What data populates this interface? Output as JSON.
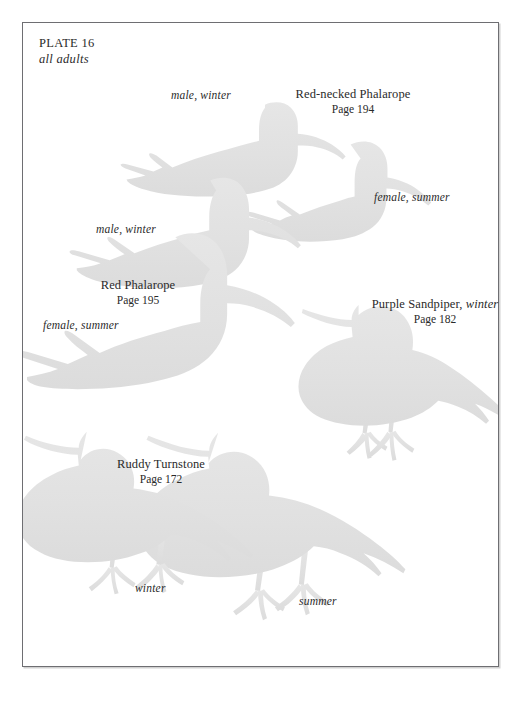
{
  "plate": {
    "number_label": "PLATE 16",
    "subtitle": "all adults",
    "background_color": "#ffffff",
    "frame_color": "#6e6e72",
    "silhouette_color": "#e2e2e2",
    "text_color": "#2e2e30"
  },
  "species": [
    {
      "id": "red-necked-phalarope",
      "name": "Red-necked Phalarope",
      "name_italic_suffix": "",
      "page": "Page 194",
      "morphs": [
        "male, winter",
        "female, summer"
      ]
    },
    {
      "id": "red-phalarope",
      "name": "Red Phalarope",
      "name_italic_suffix": "",
      "page": "Page 195",
      "morphs": [
        "male, winter",
        "female, summer"
      ]
    },
    {
      "id": "purple-sandpiper",
      "name": "Purple Sandpiper,",
      "name_italic_suffix": "winter",
      "page": "Page 182",
      "morphs": []
    },
    {
      "id": "ruddy-turnstone",
      "name": "Ruddy Turnstone",
      "name_italic_suffix": "",
      "page": "Page 172",
      "morphs": [
        "winter",
        "summer"
      ]
    }
  ],
  "labels": {
    "rnph_male_winter": "male, winter",
    "rnph_female_summer": "female, summer",
    "redph_male_winter": "male, winter",
    "redph_female_summer": "female, summer",
    "ruturn_winter": "winter",
    "ruturn_summer": "summer"
  },
  "illustrations": [
    {
      "name": "red-necked-phalarope-male-winter-silhouette"
    },
    {
      "name": "red-necked-phalarope-female-summer-silhouette"
    },
    {
      "name": "red-phalarope-male-winter-silhouette"
    },
    {
      "name": "red-phalarope-female-summer-silhouette"
    },
    {
      "name": "purple-sandpiper-winter-silhouette"
    },
    {
      "name": "ruddy-turnstone-winter-silhouette"
    },
    {
      "name": "ruddy-turnstone-summer-silhouette"
    }
  ]
}
